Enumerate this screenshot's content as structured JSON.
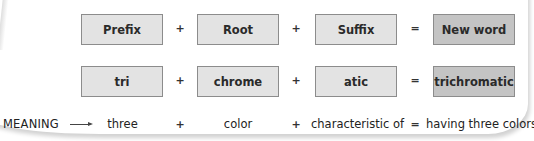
{
  "header_row": {
    "prefix": "Prefix",
    "root": "Root",
    "suffix": "Suffix",
    "result": "New word"
  },
  "example_row": {
    "prefix": "tri",
    "root": "chrome",
    "suffix": "atic",
    "result": "trichromatic"
  },
  "meaning_row": {
    "label": "MEANING",
    "prefix": "three",
    "root": "color",
    "suffix": "characteristic of",
    "result": "having three colors"
  },
  "operators": {
    "plus": "+",
    "equals": "="
  },
  "colors": {
    "part_box_fill": "#e3e3e3",
    "result_box_fill": "#c4c4c4",
    "box_border": "#8c8c8c"
  }
}
